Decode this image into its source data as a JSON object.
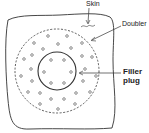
{
  "diagram": {
    "labels": {
      "skin": "Skin",
      "doubler": "Doubler",
      "filler_line1": "Filler",
      "filler_line2": "plug"
    },
    "components": [
      {
        "name": "skin",
        "shape": "irregular outline"
      },
      {
        "name": "doubler",
        "shape": "dashed circle"
      },
      {
        "name": "filler-plug",
        "shape": "solid circle"
      }
    ],
    "fasteners": {
      "outer_ring_count": 24,
      "inner_ring_count": 8
    },
    "colors": {
      "line": "#333333",
      "background": "#ffffff"
    }
  }
}
